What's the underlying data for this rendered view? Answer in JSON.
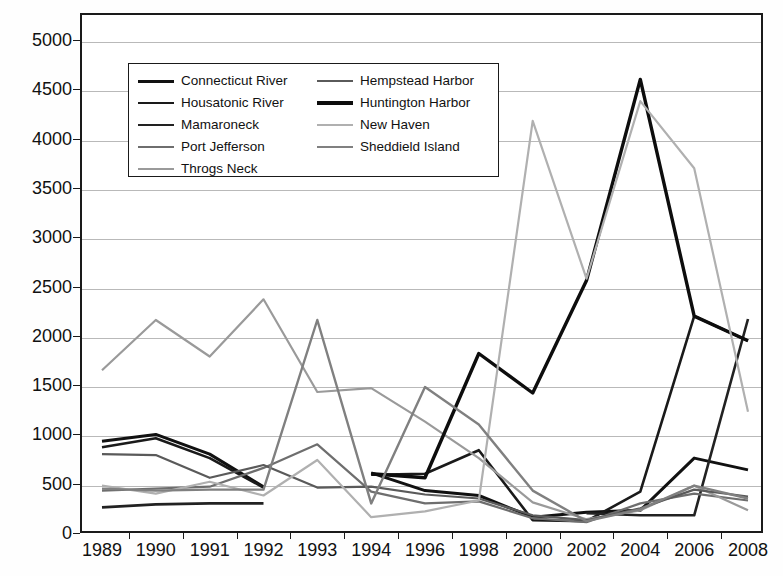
{
  "chart_data": {
    "type": "line",
    "title": "",
    "xlabel": "",
    "ylabel": "",
    "grid": true,
    "legend_position": "inside-top-left",
    "ylim": [
      0,
      5000
    ],
    "yticks": [
      0,
      500,
      1000,
      1500,
      2000,
      2500,
      3000,
      3500,
      4000,
      4500,
      5000
    ],
    "ytick_labels": [
      "0",
      "500",
      "1000",
      "1500",
      "2000",
      "2500",
      "3000",
      "3500",
      "4000",
      "4500",
      "5000"
    ],
    "categories": [
      "1989",
      "1990",
      "1991",
      "1992",
      "1993",
      "1994",
      "1996",
      "1998",
      "2000",
      "2002",
      "2004",
      "2006",
      "2008"
    ],
    "series": [
      {
        "name": "Connecticut River",
        "color": "#111111",
        "width": 3.0,
        "values": [
          930,
          1000,
          800,
          470,
          null,
          610,
          430,
          380,
          160,
          210,
          230,
          760,
          640
        ]
      },
      {
        "name": "Housatonic River",
        "color": "#1a1a1a",
        "width": 2.6,
        "values": [
          870,
          960,
          760,
          460,
          null,
          590,
          600,
          840,
          130,
          120,
          420,
          2200,
          1950
        ]
      },
      {
        "name": "Mamaroneck",
        "color": "#222222",
        "width": 2.6,
        "values": [
          260,
          290,
          300,
          300,
          null,
          null,
          null,
          null,
          null,
          200,
          180,
          180,
          2170
        ]
      },
      {
        "name": "Port Jefferson",
        "color": "#6e6e6e",
        "width": 2.2,
        "values": [
          430,
          450,
          470,
          660,
          900,
          420,
          300,
          320,
          150,
          110,
          300,
          400,
          330
        ]
      },
      {
        "name": "Throgs Neck",
        "color": "#9a9a9a",
        "width": 2.2,
        "values": [
          1650,
          2160,
          1790,
          2370,
          1430,
          1470,
          1130,
          760,
          310,
          140,
          230,
          480,
          230
        ]
      },
      {
        "name": "Hempstead Harbor",
        "color": "#5a5a5a",
        "width": 2.2,
        "values": [
          800,
          790,
          560,
          690,
          460,
          470,
          390,
          350,
          180,
          130,
          250,
          440,
          370
        ]
      },
      {
        "name": "Huntington Harbor",
        "color": "#0d0d0d",
        "width": 3.4,
        "values": [
          null,
          null,
          null,
          null,
          null,
          600,
          560,
          1820,
          1420,
          2560,
          4600,
          2200,
          1950
        ]
      },
      {
        "name": "New Haven",
        "color": "#b0b0b0",
        "width": 2.2,
        "values": [
          480,
          400,
          520,
          380,
          740,
          160,
          220,
          330,
          4180,
          2580,
          4380,
          3700,
          1230
        ]
      },
      {
        "name": "Sheddield Island",
        "color": "#808080",
        "width": 2.4,
        "values": [
          450,
          430,
          440,
          440,
          2160,
          300,
          1480,
          1100,
          430,
          120,
          240,
          480,
          350
        ]
      }
    ]
  },
  "legend": {
    "columns": [
      {
        "items": [
          {
            "label": "Connecticut River",
            "color": "#111111",
            "width": 3.0
          },
          {
            "label": "Housatonic River",
            "color": "#1a1a1a",
            "width": 2.8
          },
          {
            "label": "Mamaroneck",
            "color": "#222222",
            "width": 2.8
          },
          {
            "label": "Port Jefferson",
            "color": "#6e6e6e",
            "width": 2.0
          },
          {
            "label": "Throgs Neck",
            "color": "#9a9a9a",
            "width": 2.0
          }
        ]
      },
      {
        "items": [
          {
            "label": "Hempstead Harbor",
            "color": "#5a5a5a",
            "width": 2.2
          },
          {
            "label": "Huntington Harbor",
            "color": "#0d0d0d",
            "width": 3.4
          },
          {
            "label": "New Haven",
            "color": "#b0b0b0",
            "width": 2.0
          },
          {
            "label": "Sheddield Island",
            "color": "#808080",
            "width": 2.4
          }
        ]
      }
    ]
  }
}
